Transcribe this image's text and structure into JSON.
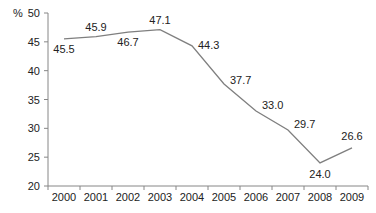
{
  "chart_data": {
    "type": "line",
    "title": "",
    "xlabel": "",
    "ylabel": "%",
    "categories": [
      "2000",
      "2001",
      "2002",
      "2003",
      "2004",
      "2005",
      "2006",
      "2007",
      "2008",
      "2009"
    ],
    "series": [
      {
        "name": "",
        "values": [
          45.5,
          45.9,
          46.7,
          47.1,
          44.3,
          37.7,
          33.0,
          29.7,
          24.0,
          26.6
        ],
        "labels": [
          "45.5",
          "45.9",
          "46.7",
          "47.1",
          "44.3",
          "37.7",
          "33.0",
          "29.7",
          "24.0",
          "26.6"
        ]
      }
    ],
    "ylim": [
      20,
      50
    ],
    "yticks": [
      "20",
      "25",
      "30",
      "35",
      "40",
      "45",
      "50"
    ],
    "grid": false,
    "legend": "none",
    "line_color": "#7f7f7f"
  }
}
